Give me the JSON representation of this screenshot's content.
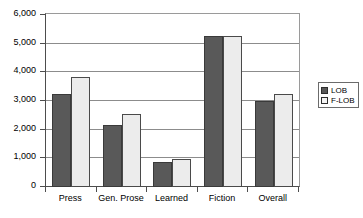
{
  "chart_data": {
    "type": "bar",
    "title": "",
    "xlabel": "",
    "ylabel": "",
    "categories": [
      "Press",
      "Gen. Prose",
      "Learned",
      "Fiction",
      "Overall"
    ],
    "series": [
      {
        "name": "LOB",
        "values": [
          3240,
          2160,
          870,
          5280,
          2990
        ]
      },
      {
        "name": "F-LOB",
        "values": [
          3830,
          2540,
          960,
          5260,
          3230
        ]
      }
    ],
    "ylim": [
      0,
      6000
    ],
    "ytick_values": [
      0,
      1000,
      2000,
      3000,
      4000,
      5000,
      6000
    ],
    "ytick_labels": [
      "0",
      "1,000",
      "2,000",
      "3,000",
      "4,000",
      "5,000",
      "6,000"
    ],
    "grid": true,
    "legend_position": "right",
    "colors": {
      "lob": "#595959",
      "flob": "#ececec",
      "border": "#3a3a3a",
      "gridline": "#8c8c8c",
      "axis": "#4d4d4d",
      "background": "#ffffff"
    }
  }
}
